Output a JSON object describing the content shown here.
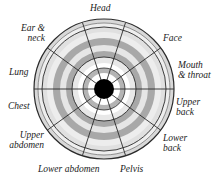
{
  "diagram": {
    "type": "radial-target-chart",
    "center_color": "#000000",
    "ring_colors_outer_to_inner": [
      "#d8d8d8",
      "#eeeeee",
      "#d0d0d0",
      "#a8a8a8",
      "#e6e6e6",
      "#a8a8a8",
      "#e4e4e4",
      "#ffffff",
      "#b0b0b0",
      "#ffffff"
    ],
    "line_color": "#2a2a2a",
    "sector_count": 10,
    "sectors": [
      {
        "label_line1": "Head",
        "label_line2": ""
      },
      {
        "label_line1": "Face",
        "label_line2": ""
      },
      {
        "label_line1": "Mouth",
        "label_line2": "& throat"
      },
      {
        "label_line1": "Upper",
        "label_line2": "back"
      },
      {
        "label_line1": "Lower",
        "label_line2": "back"
      },
      {
        "label_line1": "Pelvis",
        "label_line2": ""
      },
      {
        "label_line1": "Lower abdomen",
        "label_line2": ""
      },
      {
        "label_line1": "Upper",
        "label_line2": "abdomen"
      },
      {
        "label_line1": "Chest",
        "label_line2": ""
      },
      {
        "label_line1": "Lung",
        "label_line2": ""
      },
      {
        "label_line1": "Ear &",
        "label_line2": "neck"
      }
    ]
  }
}
